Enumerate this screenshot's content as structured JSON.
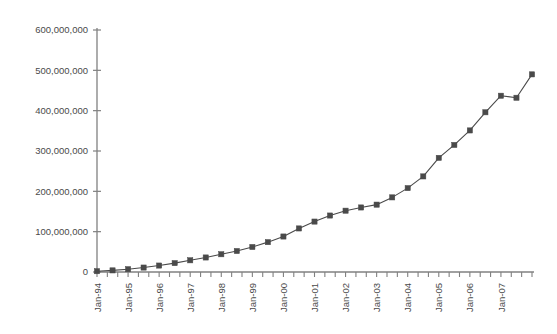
{
  "chart_data": {
    "type": "line",
    "title": "",
    "subtitle": "",
    "xlabel": "",
    "ylabel": "",
    "grid": false,
    "legend": "none",
    "marker": "square",
    "series_color": "#4a4a4a",
    "axis_color": "#808080",
    "ylim": [
      0,
      600000000
    ],
    "ytick_values": [
      0,
      100000000,
      200000000,
      300000000,
      400000000,
      500000000,
      600000000
    ],
    "ytick_labels": [
      "0",
      "100,000,000",
      "200,000,000",
      "300,000,000",
      "400,000,000",
      "500,000,000",
      "600,000,000"
    ],
    "xtick_labels": [
      "Jan-94",
      "Jan-95",
      "Jan-96",
      "Jan-97",
      "Jan-98",
      "Jan-99",
      "Jan-00",
      "Jan-01",
      "Jan-02",
      "Jan-03",
      "Jan-04",
      "Jan-05",
      "Jan-06",
      "Jan-07"
    ],
    "xlabel_rotation": -90,
    "x": [
      "Jan-94",
      "Jul-94",
      "Jan-95",
      "Jul-95",
      "Jan-96",
      "Jul-96",
      "Jan-97",
      "Jul-97",
      "Jan-98",
      "Jul-98",
      "Jan-99",
      "Jul-99",
      "Jan-00",
      "Jul-00",
      "Jan-01",
      "Jul-01",
      "Jan-02",
      "Jul-02",
      "Jan-03",
      "Jul-03",
      "Jan-04",
      "Jul-04",
      "Jan-05",
      "Jul-05",
      "Jan-06",
      "Jul-06",
      "Jan-07",
      "Jul-07"
    ],
    "values": [
      2000000,
      4000000,
      7000000,
      11000000,
      16000000,
      22000000,
      29000000,
      36000000,
      44000000,
      52000000,
      62000000,
      74000000,
      88000000,
      108000000,
      125000000,
      140000000,
      152000000,
      160000000,
      167000000,
      185000000,
      208000000,
      237000000,
      283000000,
      315000000,
      351000000,
      396000000,
      437000000,
      432000000
    ],
    "last_point_value": 490000000,
    "last_point_label": "Sep-07"
  },
  "plot_geometry": {
    "left": 97,
    "right": 532,
    "top": 30,
    "bottom": 272
  }
}
